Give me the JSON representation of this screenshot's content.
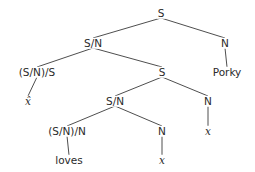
{
  "diagram": {
    "type": "syntax-tree",
    "nodes": [
      {
        "id": "n0",
        "label": "S",
        "x": 161,
        "y": 13,
        "style": "category"
      },
      {
        "id": "n1",
        "label": "S/N",
        "x": 93,
        "y": 43,
        "style": "category"
      },
      {
        "id": "n2",
        "label": "N",
        "x": 225,
        "y": 43,
        "style": "category"
      },
      {
        "id": "n3",
        "label": "(S/N)/S",
        "x": 37,
        "y": 72,
        "style": "category"
      },
      {
        "id": "n4",
        "label": "S",
        "x": 162,
        "y": 72,
        "style": "category"
      },
      {
        "id": "n5",
        "label": "Porky",
        "x": 227,
        "y": 72,
        "style": "word"
      },
      {
        "id": "n6",
        "label": "x̂",
        "x": 28,
        "y": 101,
        "style": "variable"
      },
      {
        "id": "n7",
        "label": "S/N",
        "x": 115,
        "y": 101,
        "style": "category"
      },
      {
        "id": "n8",
        "label": "N",
        "x": 208,
        "y": 101,
        "style": "category"
      },
      {
        "id": "n9",
        "label": "(S/N)/N",
        "x": 67,
        "y": 131,
        "style": "category"
      },
      {
        "id": "n10",
        "label": "N",
        "x": 162,
        "y": 131,
        "style": "category"
      },
      {
        "id": "n11",
        "label": "x",
        "x": 208,
        "y": 131,
        "style": "variable"
      },
      {
        "id": "n12",
        "label": "loves",
        "x": 69,
        "y": 160,
        "style": "word"
      },
      {
        "id": "n13",
        "label": "x",
        "x": 162,
        "y": 160,
        "style": "variable"
      }
    ],
    "edges": [
      {
        "from": "n0",
        "to": "n1"
      },
      {
        "from": "n0",
        "to": "n2"
      },
      {
        "from": "n1",
        "to": "n3"
      },
      {
        "from": "n1",
        "to": "n4"
      },
      {
        "from": "n2",
        "to": "n5"
      },
      {
        "from": "n3",
        "to": "n6"
      },
      {
        "from": "n4",
        "to": "n7"
      },
      {
        "from": "n4",
        "to": "n8"
      },
      {
        "from": "n7",
        "to": "n9"
      },
      {
        "from": "n7",
        "to": "n10"
      },
      {
        "from": "n8",
        "to": "n11"
      },
      {
        "from": "n9",
        "to": "n12"
      },
      {
        "from": "n10",
        "to": "n13"
      }
    ],
    "colors": {
      "line": "#3a3a3a",
      "text": "#2a2a2a",
      "background": "#ffffff"
    }
  }
}
